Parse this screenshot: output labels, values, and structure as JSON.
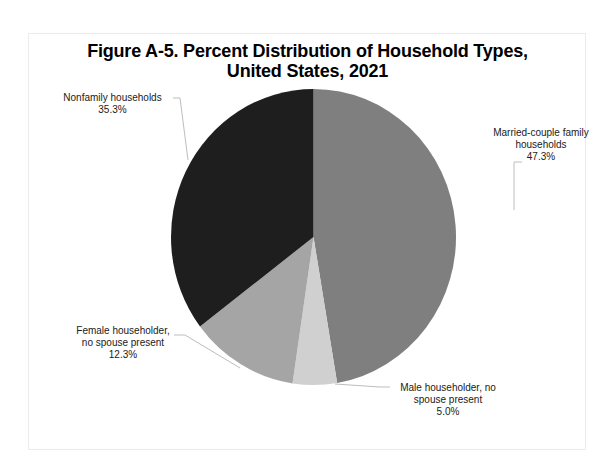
{
  "chart_data": {
    "type": "pie",
    "title": "Figure A-5. Percent Distribution of Household Types, United States, 2021",
    "title_lines": [
      "Figure A-5. Percent Distribution of Household Types,",
      "United States, 2021"
    ],
    "categories": [
      "Married-couple family households",
      "Male householder, no spouse present",
      "Female householder, no spouse present",
      "Nonfamily households"
    ],
    "values": [
      47.3,
      5.0,
      12.3,
      35.3
    ],
    "unit": "%",
    "colors": [
      "#7f7f7f",
      "#d0d0d0",
      "#a5a5a5",
      "#1e1e1e"
    ],
    "start_angle": "12 o'clock",
    "direction": "clockwise",
    "legend": "none (data labels with leader lines)",
    "labels": [
      {
        "lines": [
          "Married-couple family",
          "households",
          "47.3%"
        ]
      },
      {
        "lines": [
          "Male householder,  no",
          "spouse present",
          "5.0%"
        ]
      },
      {
        "lines": [
          "Female householder,",
          "no spouse present",
          "12.3%"
        ]
      },
      {
        "lines": [
          "Nonfamily households",
          "35.3%"
        ]
      }
    ]
  }
}
